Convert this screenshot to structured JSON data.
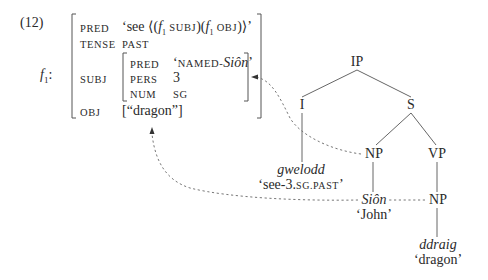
{
  "example_number": "(12)",
  "fstructure": {
    "label": "f",
    "label_sub": "1",
    "label_colon": ":",
    "rows": {
      "pred": {
        "attr": "PRED",
        "value_prefix": "‘see ⟨(",
        "f": "f",
        "sub1": "1",
        "subj": " SUBJ",
        "mid": ")(",
        "f2": "f",
        "sub2": "1",
        "obj": " OBJ",
        "suffix": ")⟩’"
      },
      "tense": {
        "attr": "TENSE",
        "value": "PAST"
      },
      "subj": {
        "attr": "SUBJ",
        "rows": {
          "pred": {
            "attr": "PRED",
            "value_prefix": "‘",
            "value_sc": "NAMED-",
            "value_it": "Siôn",
            "value_suffix": "’"
          },
          "pers": {
            "attr": "PERS",
            "value": "3"
          },
          "num": {
            "attr": "NUM",
            "value": "SG"
          }
        }
      },
      "obj": {
        "attr": "OBJ",
        "value": "[“dragon”]"
      }
    }
  },
  "tree": {
    "nodes": {
      "ip": "IP",
      "i": "I",
      "s": "S",
      "np_subj": "NP",
      "vp": "VP",
      "np_obj": "NP"
    },
    "leaves": {
      "verb": {
        "form": "gwelodd",
        "gloss_prefix": "‘see-3.",
        "gloss_sc": "SG.PAST",
        "gloss_suffix": "’"
      },
      "subj": {
        "form": "Siôn",
        "gloss": "‘John’"
      },
      "obj": {
        "form": "ddraig",
        "gloss": "‘dragon’"
      }
    }
  },
  "colors": {
    "text": "#2a2a2a",
    "line": "#555555",
    "dotted": "#777777"
  }
}
